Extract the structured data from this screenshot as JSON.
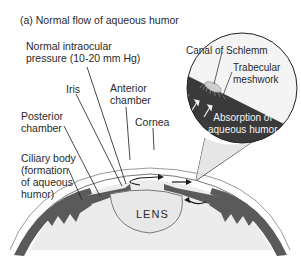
{
  "figure": {
    "title": "(a) Normal flow of aqueous humor",
    "labels": {
      "pressure": "Normal intraocular\npressure (10-20 mm Hg)",
      "iris": "Iris",
      "anterior_chamber": "Anterior\nchamber",
      "cornea": "Cornea",
      "posterior_chamber": "Posterior\nchamber",
      "ciliary_body": "Ciliary body\n(formation\nof aqueous\nhumor)",
      "lens": "LENS",
      "canal_of_schlemm": "Canal of Schlemm",
      "trabecular_meshwork": "Trabecular\nmeshwork",
      "absorption": "Absorption of\naqueous humor"
    },
    "colors": {
      "dark_tissue": "#5a5a5a",
      "inset_dark": "#3a3a3a",
      "light_fill": "#e6e6e6",
      "lens_fill": "#e8e8e8",
      "line": "#1a1a1a"
    }
  }
}
